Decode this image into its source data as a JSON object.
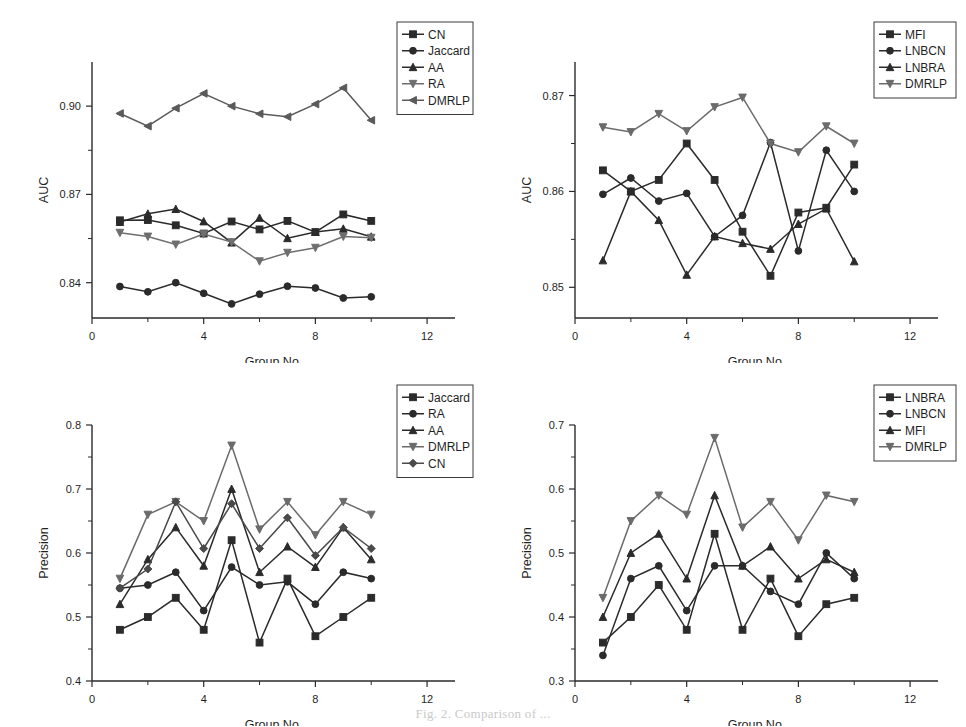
{
  "figure": {
    "caption": "Fig. 2.   Comparison of ...",
    "panel_count": 4
  },
  "chart_data": [
    {
      "id": "top-left",
      "type": "line",
      "title": "",
      "xlabel": "Group No.",
      "ylabel": "AUC",
      "xlim": [
        0,
        13
      ],
      "ylim": [
        0.828,
        0.915
      ],
      "xticks": [
        0,
        4,
        8,
        12
      ],
      "xticklabels": [
        "0",
        "4",
        "8",
        "12"
      ],
      "yticks": [
        0.84,
        0.87,
        0.9
      ],
      "yticklabels": [
        "0.84",
        "0.87",
        "0.90"
      ],
      "grid": false,
      "legend_position": "top-right",
      "x": [
        1,
        2,
        3,
        4,
        5,
        6,
        7,
        8,
        9,
        10
      ],
      "series": [
        {
          "name": "CN",
          "marker": "square",
          "color": "#2b2b2b",
          "values": [
            0.8612,
            0.8613,
            0.8595,
            0.8567,
            0.8608,
            0.8581,
            0.861,
            0.8572,
            0.8632,
            0.861
          ]
        },
        {
          "name": "Jaccard",
          "marker": "circle",
          "color": "#2b2b2b",
          "values": [
            0.8387,
            0.8369,
            0.84,
            0.8364,
            0.8328,
            0.8361,
            0.8388,
            0.8382,
            0.8348,
            0.8352
          ]
        },
        {
          "name": "AA",
          "marker": "triangle-up",
          "color": "#2b2b2b",
          "values": [
            0.8606,
            0.8634,
            0.865,
            0.8608,
            0.8536,
            0.862,
            0.8551,
            0.8572,
            0.8583,
            0.8556
          ]
        },
        {
          "name": "RA",
          "marker": "triangle-down",
          "color": "#6e6e6e",
          "values": [
            0.857,
            0.8557,
            0.853,
            0.8565,
            0.8538,
            0.8473,
            0.8502,
            0.8519,
            0.8557,
            0.8553
          ]
        },
        {
          "name": "DMRLP",
          "marker": "triangle-left",
          "color": "#5a5a5a",
          "values": [
            0.8975,
            0.8932,
            0.8993,
            0.9043,
            0.9,
            0.8974,
            0.8964,
            0.9007,
            0.9062,
            0.8952
          ]
        }
      ]
    },
    {
      "id": "top-right",
      "type": "line",
      "title": "",
      "xlabel": "Group No.",
      "ylabel": "AUC",
      "xlim": [
        0,
        13
      ],
      "ylim": [
        0.8468,
        0.8735
      ],
      "xticks": [
        0,
        4,
        8,
        12
      ],
      "xticklabels": [
        "0",
        "4",
        "8",
        "12"
      ],
      "yticks": [
        0.85,
        0.86,
        0.87
      ],
      "yticklabels": [
        "0.85",
        "0.86",
        "0.87"
      ],
      "grid": false,
      "legend_position": "top-right",
      "x": [
        1,
        2,
        3,
        4,
        5,
        6,
        7,
        8,
        9,
        10
      ],
      "series": [
        {
          "name": "MFI",
          "marker": "square",
          "color": "#2b2b2b",
          "values": [
            0.8622,
            0.86,
            0.8612,
            0.865,
            0.8612,
            0.8558,
            0.8512,
            0.8578,
            0.8583,
            0.8628
          ]
        },
        {
          "name": "LNBCN",
          "marker": "circle",
          "color": "#2b2b2b",
          "values": [
            0.8597,
            0.8614,
            0.859,
            0.8598,
            0.8553,
            0.8575,
            0.8651,
            0.8538,
            0.8643,
            0.86
          ]
        },
        {
          "name": "LNBRA",
          "marker": "triangle-up",
          "color": "#2b2b2b",
          "values": [
            0.8528,
            0.86,
            0.857,
            0.8513,
            0.8553,
            0.8546,
            0.854,
            0.8566,
            0.8582,
            0.8527
          ]
        },
        {
          "name": "DMRLP",
          "marker": "triangle-down",
          "color": "#6b6b6b",
          "values": [
            0.8667,
            0.8662,
            0.8681,
            0.8663,
            0.8688,
            0.8698,
            0.865,
            0.8641,
            0.8668,
            0.865
          ]
        }
      ]
    },
    {
      "id": "bottom-left",
      "type": "line",
      "title": "",
      "xlabel": "Group No.",
      "ylabel": "Precision",
      "xlim": [
        0,
        13
      ],
      "ylim": [
        0.4,
        0.8
      ],
      "xticks": [
        0,
        4,
        8,
        12
      ],
      "xticklabels": [
        "0",
        "4",
        "8",
        "12"
      ],
      "yticks": [
        0.4,
        0.5,
        0.6,
        0.7,
        0.8
      ],
      "yticklabels": [
        "0.4",
        "0.5",
        "0.6",
        "0.7",
        "0.8"
      ],
      "grid": false,
      "legend_position": "top-right",
      "x": [
        1,
        2,
        3,
        4,
        5,
        6,
        7,
        8,
        9,
        10
      ],
      "series": [
        {
          "name": "Jaccard",
          "marker": "square",
          "color": "#2b2b2b",
          "values": [
            0.48,
            0.5,
            0.53,
            0.48,
            0.62,
            0.46,
            0.56,
            0.47,
            0.5,
            0.53
          ]
        },
        {
          "name": "RA",
          "marker": "circle",
          "color": "#2b2b2b",
          "values": [
            0.545,
            0.55,
            0.57,
            0.51,
            0.578,
            0.55,
            0.555,
            0.52,
            0.57,
            0.56
          ]
        },
        {
          "name": "AA",
          "marker": "triangle-up",
          "color": "#2b2b2b",
          "values": [
            0.52,
            0.59,
            0.64,
            0.58,
            0.7,
            0.57,
            0.61,
            0.578,
            0.64,
            0.59
          ]
        },
        {
          "name": "DMRLP",
          "marker": "triangle-down",
          "color": "#6b6b6b",
          "values": [
            0.56,
            0.66,
            0.68,
            0.65,
            0.768,
            0.637,
            0.68,
            0.628,
            0.68,
            0.66
          ]
        },
        {
          "name": "CN",
          "marker": "diamond",
          "color": "#4a4a4a",
          "values": [
            0.545,
            0.575,
            0.68,
            0.607,
            0.677,
            0.607,
            0.655,
            0.596,
            0.64,
            0.607
          ]
        }
      ]
    },
    {
      "id": "bottom-right",
      "type": "line",
      "title": "",
      "xlabel": "Group No.",
      "ylabel": "Precision",
      "xlim": [
        0,
        13
      ],
      "ylim": [
        0.3,
        0.7
      ],
      "xticks": [
        0,
        4,
        8,
        12
      ],
      "xticklabels": [
        "0",
        "4",
        "8",
        "12"
      ],
      "yticks": [
        0.3,
        0.4,
        0.5,
        0.6,
        0.7
      ],
      "yticklabels": [
        "0.3",
        "0.4",
        "0.5",
        "0.6",
        "0.7"
      ],
      "grid": false,
      "legend_position": "top-right",
      "x": [
        1,
        2,
        3,
        4,
        5,
        6,
        7,
        8,
        9,
        10
      ],
      "series": [
        {
          "name": "LNBRA",
          "marker": "square",
          "color": "#2b2b2b",
          "values": [
            0.36,
            0.4,
            0.45,
            0.38,
            0.53,
            0.38,
            0.46,
            0.37,
            0.42,
            0.43
          ]
        },
        {
          "name": "LNBCN",
          "marker": "circle",
          "color": "#2b2b2b",
          "values": [
            0.34,
            0.46,
            0.48,
            0.41,
            0.48,
            0.48,
            0.44,
            0.42,
            0.5,
            0.46
          ]
        },
        {
          "name": "MFI",
          "marker": "triangle-up",
          "color": "#2b2b2b",
          "values": [
            0.4,
            0.5,
            0.53,
            0.46,
            0.59,
            0.48,
            0.51,
            0.46,
            0.49,
            0.47
          ]
        },
        {
          "name": "DMRLP",
          "marker": "triangle-down",
          "color": "#6b6b6b",
          "values": [
            0.43,
            0.55,
            0.59,
            0.56,
            0.68,
            0.54,
            0.58,
            0.52,
            0.59,
            0.58
          ]
        }
      ]
    }
  ]
}
